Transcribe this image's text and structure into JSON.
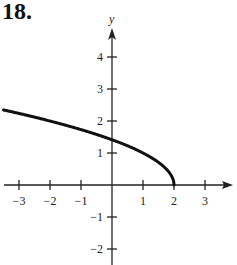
{
  "problem": {
    "number": "18."
  },
  "chart_data": {
    "type": "line",
    "title": "",
    "xlabel": "",
    "ylabel": "y",
    "function": "y = sqrt(2 - x)",
    "xlim": [
      -3.5,
      3.9
    ],
    "ylim": [
      -2.6,
      4.9
    ],
    "grid": false,
    "x_ticks": [
      -3,
      -2,
      -1,
      1,
      2,
      3
    ],
    "x_tick_labels": [
      "−3",
      "−2",
      "−1",
      "1",
      "2",
      "3"
    ],
    "y_ticks": [
      4,
      3,
      2,
      1,
      -1,
      -2
    ],
    "y_tick_labels": [
      "4",
      "3",
      "2",
      "1",
      "−1",
      "−2"
    ],
    "series": [
      {
        "name": "curve",
        "x": [
          -3.5,
          -3,
          -2,
          -1,
          0,
          1,
          1.5,
          1.8,
          1.95,
          2
        ],
        "y": [
          2.35,
          2.24,
          2.0,
          1.73,
          1.41,
          1.0,
          0.71,
          0.45,
          0.22,
          0.0
        ]
      }
    ],
    "endpoint": {
      "x": 2,
      "y": 0
    }
  },
  "style": {
    "axis_color": "#222222",
    "curve_color": "#111111"
  }
}
